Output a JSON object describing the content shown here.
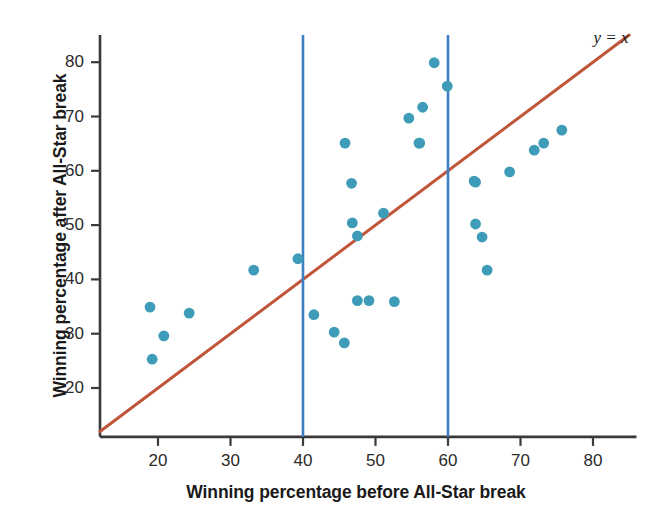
{
  "chart_data": {
    "type": "scatter",
    "title": "",
    "xlabel": "Winning percentage before All-Star break",
    "ylabel": "Winning percentage after All-Star break",
    "xlim": [
      12,
      86
    ],
    "ylim": [
      11,
      85
    ],
    "xticks": [
      20,
      30,
      40,
      50,
      60,
      70,
      80
    ],
    "yticks": [
      20,
      30,
      40,
      50,
      60,
      70,
      80
    ],
    "grid": false,
    "legend": false,
    "point_color": "#3f9cb8",
    "reference_line_color": "#c0553a",
    "vline_color": "#3b7fc4",
    "annotations": [
      {
        "text": "y = x",
        "x": 82,
        "y": 84,
        "style": "italic-serif"
      }
    ],
    "reference_lines": [
      {
        "name": "identity",
        "type": "line",
        "equation": "y = x",
        "from": [
          12,
          12
        ],
        "to": [
          85,
          85
        ],
        "color": "#c0553a"
      },
      {
        "name": "vline-40",
        "type": "vline",
        "x": 40,
        "y_from": 11,
        "y_to": 85,
        "color": "#3b7fc4"
      },
      {
        "name": "vline-60",
        "type": "vline",
        "x": 60,
        "y_from": 11,
        "y_to": 85,
        "color": "#3b7fc4"
      }
    ],
    "points": [
      {
        "x": 18.9,
        "y": 34.9
      },
      {
        "x": 19.2,
        "y": 25.3
      },
      {
        "x": 20.8,
        "y": 29.6
      },
      {
        "x": 24.3,
        "y": 33.8
      },
      {
        "x": 33.2,
        "y": 41.7
      },
      {
        "x": 39.3,
        "y": 43.8
      },
      {
        "x": 41.5,
        "y": 33.5
      },
      {
        "x": 44.3,
        "y": 30.3
      },
      {
        "x": 45.7,
        "y": 28.3
      },
      {
        "x": 45.8,
        "y": 65.1
      },
      {
        "x": 46.7,
        "y": 57.7
      },
      {
        "x": 46.8,
        "y": 50.4
      },
      {
        "x": 47.5,
        "y": 48.0
      },
      {
        "x": 47.5,
        "y": 36.1
      },
      {
        "x": 49.1,
        "y": 36.1
      },
      {
        "x": 51.1,
        "y": 52.2
      },
      {
        "x": 52.6,
        "y": 35.9
      },
      {
        "x": 54.6,
        "y": 69.7
      },
      {
        "x": 56.0,
        "y": 65.1
      },
      {
        "x": 56.1,
        "y": 65.1
      },
      {
        "x": 56.5,
        "y": 71.7
      },
      {
        "x": 58.1,
        "y": 79.9
      },
      {
        "x": 59.9,
        "y": 75.6
      },
      {
        "x": 63.6,
        "y": 58.1
      },
      {
        "x": 63.8,
        "y": 57.9
      },
      {
        "x": 63.8,
        "y": 50.2
      },
      {
        "x": 64.7,
        "y": 47.8
      },
      {
        "x": 65.4,
        "y": 41.7
      },
      {
        "x": 68.5,
        "y": 59.8
      },
      {
        "x": 71.9,
        "y": 63.8
      },
      {
        "x": 73.2,
        "y": 65.1
      },
      {
        "x": 75.7,
        "y": 67.5
      }
    ]
  }
}
